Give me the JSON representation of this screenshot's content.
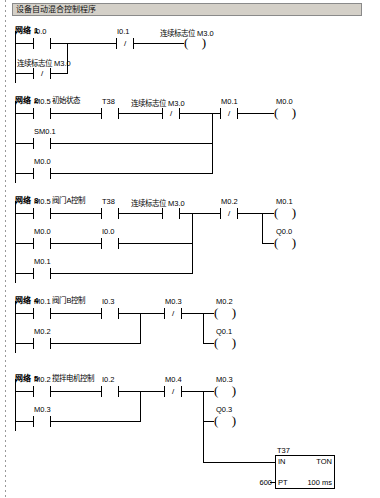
{
  "title": "设备自动混合控制程序",
  "networks": [
    {
      "label": "网络",
      "num": "1",
      "desc": ""
    },
    {
      "label": "网络",
      "num": "2",
      "desc": "初始状态"
    },
    {
      "label": "网络",
      "num": "3",
      "desc": "阀门A控制"
    },
    {
      "label": "网络",
      "num": "4",
      "desc": "阀门B控制"
    },
    {
      "label": "网络",
      "num": "5",
      "desc": "搅拌电机控制"
    }
  ],
  "n1": {
    "c1": "I0.0",
    "c2": "I0.1",
    "c3_sym": "连续标志位",
    "c3_addr": "M3.0",
    "coil_sym": "连续标志位",
    "coil_addr": "M3.0"
  },
  "n2": {
    "c1": "M0.5",
    "c2": "T38",
    "c3_sym": "连续标志位",
    "c3_addr": "M3.0",
    "c4": "M0.1",
    "b1": "SM0.1",
    "b2": "M0.0",
    "coil": "M0.0"
  },
  "n3": {
    "c1": "M0.5",
    "c2": "T38",
    "c3_sym": "连续标志位",
    "c3_addr": "M3.0",
    "c4": "M0.2",
    "b1a": "M0.0",
    "b1b": "I0.0",
    "b2": "M0.1",
    "coil1": "M0.1",
    "coil2": "Q0.0"
  },
  "n4": {
    "c1": "M0.1",
    "c2": "I0.3",
    "c3": "M0.3",
    "b1": "M0.2",
    "coil1": "M0.2",
    "coil2": "Q0.1"
  },
  "n5": {
    "c1": "M0.2",
    "c2": "I0.2",
    "c3": "M0.4",
    "b1": "M0.3",
    "coil1": "M0.3",
    "coil2": "Q0.3",
    "timer_name": "T37",
    "timer_in": "IN",
    "timer_type": "TON",
    "timer_pt": "PT",
    "timer_pv": "600",
    "timer_base": "100 ms"
  },
  "glyphs": {
    "not": "/",
    "coil_left": "(",
    "coil_right": ")"
  }
}
